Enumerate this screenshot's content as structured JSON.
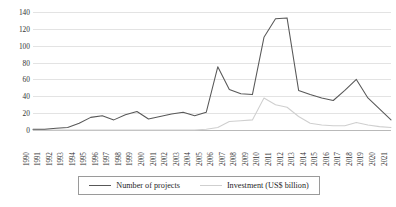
{
  "chart_data": {
    "type": "line",
    "title": "",
    "subtitle": "",
    "xlabel": "",
    "ylabel": "",
    "ylim": [
      0,
      140
    ],
    "ytick_step": 20,
    "yticks": [
      0,
      20,
      40,
      60,
      80,
      100,
      120,
      140
    ],
    "grid": true,
    "legend_position": "bottom",
    "categories": [
      "1990",
      "1991",
      "1992",
      "1993",
      "1994",
      "1995",
      "1996",
      "1997",
      "1998",
      "1999",
      "2000",
      "2001",
      "2002",
      "2003",
      "2004",
      "2005",
      "2006",
      "2007",
      "2008",
      "2009",
      "2010",
      "2011",
      "2012",
      "2013",
      "2014",
      "2015",
      "2016",
      "2017",
      "2018",
      "2019",
      "2020",
      "2021"
    ],
    "series": [
      {
        "name": "Number of projects",
        "color": "#585858",
        "values": [
          1,
          1,
          2,
          3,
          8,
          15,
          17,
          12,
          18,
          22,
          13,
          16,
          19,
          21,
          17,
          21,
          75,
          48,
          43,
          42,
          110,
          132,
          133,
          47,
          42,
          38,
          35,
          47,
          60,
          38,
          25,
          12
        ]
      },
      {
        "name": "Investment (US$ billion)",
        "color": "#cfcfcf",
        "values": [
          0,
          0,
          0,
          0,
          0,
          0,
          0,
          0,
          0,
          0,
          0,
          0,
          0,
          0,
          0,
          1,
          3,
          10,
          11,
          12,
          38,
          30,
          27,
          16,
          8,
          6,
          5,
          5,
          9,
          6,
          4,
          3
        ]
      }
    ]
  },
  "legend": {
    "items": [
      {
        "label": "Number of projects"
      },
      {
        "label": "Investment (US$ billion)"
      }
    ]
  }
}
